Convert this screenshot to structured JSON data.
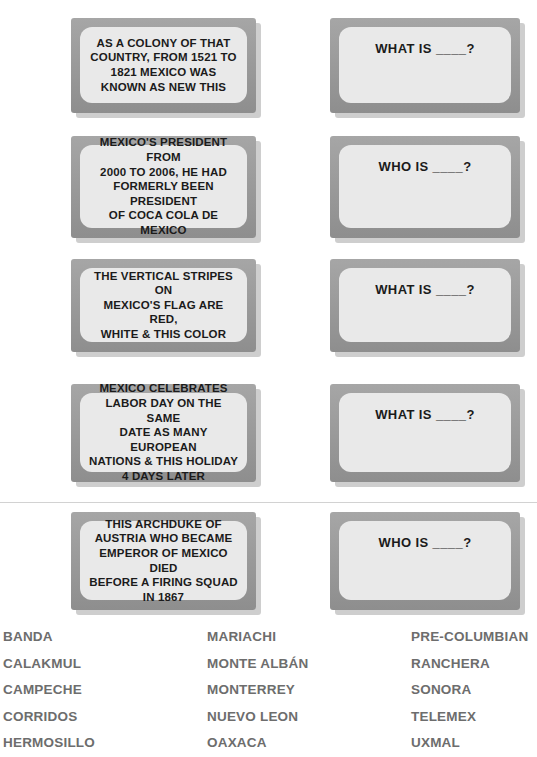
{
  "worksheet": {
    "title": "Mexico Jeopardy Worksheet",
    "rows": [
      {
        "clue": "AS A COLONY OF THAT\nCOUNTRY, FROM 1521 TO\n1821 MEXICO WAS\nKNOWN AS NEW THIS",
        "answer": "WHAT IS ____?"
      },
      {
        "clue": "MEXICO'S PRESIDENT FROM\n2000 TO 2006, HE HAD\nFORMERLY BEEN PRESIDENT\nOF COCA COLA DE\nMEXICO",
        "answer": "WHO IS ____?"
      },
      {
        "clue": "THE VERTICAL STRIPES ON\nMEXICO'S FLAG ARE RED,\nWHITE & THIS COLOR",
        "answer": "WHAT IS ____?"
      },
      {
        "clue": "MEXICO CELEBRATES\nLABOR DAY ON THE SAME\nDATE AS MANY EUROPEAN\nNATIONS & THIS HOLIDAY\n4 DAYS LATER",
        "answer": "WHAT IS ____?"
      },
      {
        "clue": "THIS ARCHDUKE OF\nAUSTRIA WHO BECAME\nEMPEROR OF MEXICO DIED\nBEFORE A FIRING SQUAD\nIN 1867",
        "answer": "WHO IS ____?"
      }
    ]
  },
  "word_bank": {
    "columns": [
      {
        "words": [
          "BANDA",
          "CALAKMUL",
          "CAMPECHE",
          "CORRIDOS",
          "HERMOSILLO"
        ]
      },
      {
        "words": [
          "MARIACHI",
          "MONTE ALBÁN",
          "MONTERREY",
          "NUEVO LEON",
          "OAXACA"
        ]
      },
      {
        "words": [
          "PRE-COLUMBIAN",
          "RANCHERA",
          "SONORA",
          "TELEMEX",
          "UXMAL"
        ]
      }
    ]
  },
  "colors": {
    "card_frame": "#9b9b9b",
    "card_inner": "#e9e9e9",
    "card_shadow": "#bdbdbd",
    "clue_text": "#1b1b1b",
    "word_bank_text": "#6d6d6d",
    "divider": "#d2d2d2",
    "page_background": "#ffffff"
  }
}
